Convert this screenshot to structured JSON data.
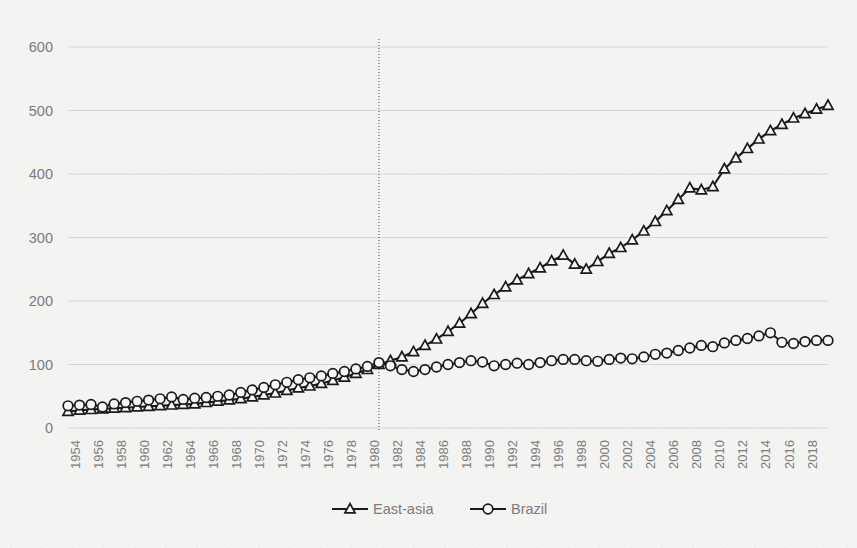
{
  "chart_data": {
    "type": "line",
    "title": "",
    "subtitle": "",
    "xlabel": "",
    "ylabel": "",
    "xlim": [
      1953,
      2019
    ],
    "ylim": [
      0,
      600
    ],
    "yticks": [
      0,
      100,
      200,
      300,
      400,
      500,
      600
    ],
    "ytick_labels": [
      "0",
      "100",
      "200",
      "300",
      "400",
      "500",
      "600"
    ],
    "grid": "horizontal",
    "legend_position": "bottom-center",
    "annotations": [
      {
        "type": "vertical-line",
        "x": 1980,
        "style": "dotted",
        "color": "#4a4a4a"
      }
    ],
    "x": [
      1953,
      1954,
      1955,
      1956,
      1957,
      1958,
      1959,
      1960,
      1961,
      1962,
      1963,
      1964,
      1965,
      1966,
      1967,
      1968,
      1969,
      1970,
      1971,
      1972,
      1973,
      1974,
      1975,
      1976,
      1977,
      1978,
      1979,
      1980,
      1981,
      1982,
      1983,
      1984,
      1985,
      1986,
      1987,
      1988,
      1989,
      1990,
      1991,
      1992,
      1993,
      1994,
      1995,
      1996,
      1997,
      1998,
      1999,
      2000,
      2001,
      2002,
      2003,
      2004,
      2005,
      2006,
      2007,
      2008,
      2009,
      2010,
      2011,
      2012,
      2013,
      2014,
      2015,
      2016,
      2017,
      2018,
      2019
    ],
    "xtick_labels": [
      "1954",
      "1956",
      "1958",
      "1960",
      "1962",
      "1964",
      "1966",
      "1968",
      "1970",
      "1972",
      "1974",
      "1976",
      "1978",
      "1980",
      "1982",
      "1984",
      "1986",
      "1988",
      "1990",
      "1992",
      "1994",
      "1996",
      "1998",
      "2000",
      "2002",
      "2004",
      "2006",
      "2008",
      "2010",
      "2012",
      "2014",
      "2016",
      "2018"
    ],
    "xticks": [
      1954,
      1956,
      1958,
      1960,
      1962,
      1964,
      1966,
      1968,
      1970,
      1972,
      1974,
      1976,
      1978,
      1980,
      1982,
      1984,
      1986,
      1988,
      1990,
      1992,
      1994,
      1996,
      1998,
      2000,
      2002,
      2004,
      2006,
      2008,
      2010,
      2012,
      2014,
      2016,
      2018
    ],
    "series": [
      {
        "name": "East-asia",
        "marker": "triangle",
        "color": "#1a1a1a",
        "values": [
          26,
          28,
          29,
          30,
          31,
          32,
          33,
          34,
          35,
          36,
          37,
          38,
          40,
          42,
          44,
          46,
          49,
          52,
          55,
          59,
          63,
          66,
          70,
          75,
          80,
          86,
          92,
          100,
          106,
          112,
          120,
          130,
          140,
          152,
          165,
          180,
          196,
          210,
          222,
          233,
          243,
          252,
          263,
          272,
          258,
          250,
          262,
          275,
          284,
          296,
          310,
          325,
          342,
          360,
          378,
          375,
          380,
          408,
          425,
          440,
          455,
          468,
          478,
          488,
          495,
          502,
          508
        ]
      },
      {
        "name": "Brazil",
        "marker": "circle",
        "color": "#1a1a1a",
        "values": [
          35,
          36,
          37,
          33,
          38,
          40,
          42,
          44,
          46,
          49,
          45,
          47,
          48,
          50,
          52,
          56,
          60,
          64,
          68,
          72,
          76,
          79,
          82,
          86,
          89,
          93,
          97,
          103,
          98,
          92,
          89,
          92,
          96,
          100,
          103,
          106,
          104,
          98,
          100,
          102,
          100,
          103,
          106,
          108,
          108,
          106,
          105,
          108,
          110,
          109,
          112,
          116,
          118,
          122,
          126,
          130,
          128,
          134,
          138,
          141,
          145,
          150,
          135,
          133,
          136,
          138,
          138
        ]
      }
    ]
  },
  "legend": {
    "items": [
      {
        "label": "East-asia",
        "marker": "triangle"
      },
      {
        "label": "Brazil",
        "marker": "circle"
      }
    ]
  },
  "axis": {
    "y_tick_0": "0",
    "y_tick_100": "100",
    "y_tick_200": "200",
    "y_tick_300": "300",
    "y_tick_400": "400",
    "y_tick_500": "500",
    "y_tick_600": "600"
  }
}
